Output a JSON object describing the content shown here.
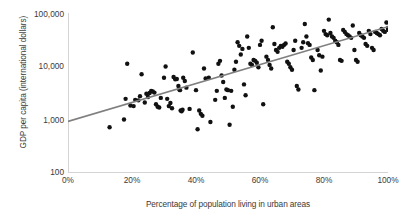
{
  "chart_data": {
    "type": "scatter",
    "title": "",
    "xlabel": "Percentage of population living in urban areas",
    "ylabel": "GDP per capita (international dollars)",
    "xlim": [
      0,
      100
    ],
    "ylim": [
      100,
      100000
    ],
    "yscale": "log",
    "xscale": "linear",
    "grid": false,
    "legend": "none",
    "xtick_labels": [
      "0%",
      "20%",
      "40%",
      "60%",
      "80%",
      "100%"
    ],
    "xtick_values": [
      0,
      20,
      40,
      60,
      80,
      100
    ],
    "ytick_labels": [
      "100",
      "1,000",
      "10,000",
      "100,000"
    ],
    "ytick_values": [
      100,
      1000,
      10000,
      100000
    ],
    "series": [
      {
        "name": "Countries",
        "marker": "circle",
        "color": "#111111",
        "points": [
          [
            13.0,
            700
          ],
          [
            17.5,
            980
          ],
          [
            18.0,
            2400
          ],
          [
            18.5,
            11000
          ],
          [
            19.5,
            1800
          ],
          [
            20.5,
            1750
          ],
          [
            21.0,
            2300
          ],
          [
            22.0,
            2250
          ],
          [
            22.5,
            2700
          ],
          [
            23.0,
            7000
          ],
          [
            24.0,
            2050
          ],
          [
            24.5,
            3000
          ],
          [
            25.0,
            2600
          ],
          [
            25.5,
            3100
          ],
          [
            26.0,
            3400
          ],
          [
            26.5,
            3300
          ],
          [
            27.0,
            3150
          ],
          [
            27.5,
            1900
          ],
          [
            28.0,
            1700
          ],
          [
            28.5,
            1650
          ],
          [
            29.0,
            2500
          ],
          [
            30.0,
            6000
          ],
          [
            30.5,
            9800
          ],
          [
            31.0,
            2400
          ],
          [
            31.5,
            1750
          ],
          [
            32.0,
            2000
          ],
          [
            32.5,
            1600
          ],
          [
            33.0,
            6200
          ],
          [
            33.5,
            5600
          ],
          [
            34.0,
            5700
          ],
          [
            34.5,
            4200
          ],
          [
            34.8,
            3600
          ],
          [
            35.0,
            3500
          ],
          [
            35.2,
            1450
          ],
          [
            35.5,
            1400
          ],
          [
            35.8,
            1500
          ],
          [
            36.0,
            6000
          ],
          [
            36.5,
            5200
          ],
          [
            37.0,
            3900
          ],
          [
            38.0,
            1550
          ],
          [
            39.0,
            18000
          ],
          [
            40.0,
            3500
          ],
          [
            40.5,
            640
          ],
          [
            41.0,
            1450
          ],
          [
            41.5,
            1250
          ],
          [
            42.0,
            1150
          ],
          [
            42.5,
            9000
          ],
          [
            43.0,
            5800
          ],
          [
            44.0,
            6000
          ],
          [
            44.5,
            880
          ],
          [
            46.0,
            2300
          ],
          [
            46.5,
            3400
          ],
          [
            47.0,
            11000
          ],
          [
            47.5,
            12500
          ],
          [
            48.0,
            6600
          ],
          [
            48.5,
            5000
          ],
          [
            49.0,
            2500
          ],
          [
            49.5,
            3600
          ],
          [
            50.0,
            3500
          ],
          [
            50.5,
            780
          ],
          [
            51.0,
            3400
          ],
          [
            51.5,
            1700
          ],
          [
            52.0,
            8500
          ],
          [
            52.5,
            12000
          ],
          [
            53.0,
            28000
          ],
          [
            53.5,
            24000
          ],
          [
            54.0,
            16500
          ],
          [
            54.5,
            21000
          ],
          [
            55.0,
            4500
          ],
          [
            55.5,
            2800
          ],
          [
            56.0,
            36000
          ],
          [
            56.5,
            22000
          ],
          [
            57.0,
            11000
          ],
          [
            57.5,
            10500
          ],
          [
            58.0,
            13000
          ],
          [
            58.5,
            12500
          ],
          [
            59.0,
            11500
          ],
          [
            59.5,
            9500
          ],
          [
            60.0,
            25000
          ],
          [
            60.5,
            30000
          ],
          [
            61.0,
            1900
          ],
          [
            62.0,
            15000
          ],
          [
            62.5,
            13000
          ],
          [
            63.0,
            10500
          ],
          [
            63.5,
            9000
          ],
          [
            64.0,
            54000
          ],
          [
            64.5,
            26000
          ],
          [
            65.0,
            20000
          ],
          [
            65.5,
            18500
          ],
          [
            66.0,
            22000
          ],
          [
            66.5,
            24000
          ],
          [
            67.0,
            23000
          ],
          [
            67.5,
            25000
          ],
          [
            68.0,
            26500
          ],
          [
            68.5,
            12000
          ],
          [
            69.0,
            11000
          ],
          [
            69.5,
            9500
          ],
          [
            70.0,
            8500
          ],
          [
            70.5,
            20000
          ],
          [
            71.0,
            30000
          ],
          [
            71.5,
            4200
          ],
          [
            72.0,
            3600
          ],
          [
            73.0,
            22000
          ],
          [
            73.5,
            28000
          ],
          [
            74.0,
            62000
          ],
          [
            74.5,
            36000
          ],
          [
            75.0,
            27000
          ],
          [
            75.5,
            25000
          ],
          [
            76.0,
            14500
          ],
          [
            76.5,
            13000
          ],
          [
            77.0,
            3500
          ],
          [
            78.0,
            20000
          ],
          [
            78.5,
            16000
          ],
          [
            79.0,
            8200
          ],
          [
            79.5,
            15000
          ],
          [
            80.0,
            46000
          ],
          [
            80.5,
            40000
          ],
          [
            81.0,
            38000
          ],
          [
            81.5,
            75000
          ],
          [
            82.0,
            42000
          ],
          [
            82.5,
            36000
          ],
          [
            83.0,
            34000
          ],
          [
            83.5,
            30000
          ],
          [
            84.0,
            28000
          ],
          [
            84.5,
            25000
          ],
          [
            85.0,
            13000
          ],
          [
            85.5,
            12500
          ],
          [
            86.0,
            48000
          ],
          [
            86.5,
            44000
          ],
          [
            87.0,
            40000
          ],
          [
            87.5,
            38000
          ],
          [
            88.0,
            36000
          ],
          [
            88.5,
            34000
          ],
          [
            89.0,
            58000
          ],
          [
            89.5,
            20000
          ],
          [
            90.0,
            13000
          ],
          [
            90.5,
            12000
          ],
          [
            91.0,
            42000
          ],
          [
            91.5,
            38000
          ],
          [
            92.0,
            36000
          ],
          [
            92.5,
            34000
          ],
          [
            93.0,
            26000
          ],
          [
            93.5,
            24000
          ],
          [
            94.0,
            46000
          ],
          [
            94.5,
            40000
          ],
          [
            95.0,
            22000
          ],
          [
            95.5,
            20000
          ],
          [
            96.0,
            44000
          ],
          [
            96.5,
            42000
          ],
          [
            97.0,
            40000
          ],
          [
            97.5,
            38000
          ],
          [
            98.0,
            50000
          ],
          [
            98.5,
            46000
          ],
          [
            99.0,
            44000
          ],
          [
            99.5,
            66000
          ],
          [
            100.0,
            52000
          ],
          [
            100.0,
            48000
          ]
        ]
      }
    ],
    "trendline": {
      "name": "linear fit (log y)",
      "color": "#808080",
      "x0": 0,
      "y0": 900,
      "x1": 100,
      "y1": 55000
    }
  },
  "axes": {
    "y_title": "GDP per capita (international dollars)",
    "x_title": "Percentage of population living in urban areas",
    "y_ticks": [
      "100,000",
      "10,000",
      "1,000",
      "100"
    ],
    "x_ticks": [
      "0%",
      "20%",
      "40%",
      "60%",
      "80%",
      "100%"
    ]
  }
}
